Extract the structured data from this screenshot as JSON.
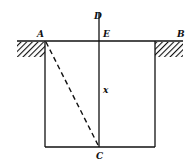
{
  "diagram": {
    "labels": {
      "A": "A",
      "B": "B",
      "C": "C",
      "D": "D",
      "E": "E",
      "x": "x"
    },
    "colors": {
      "line": "#111111",
      "background": "#ffffff"
    },
    "elements": {
      "ground_line": "AB",
      "vertical_line": "DC",
      "dashed_line": "AC",
      "rectangle": "pit",
      "hatch_left": "ground-left",
      "hatch_right": "ground-right"
    }
  }
}
